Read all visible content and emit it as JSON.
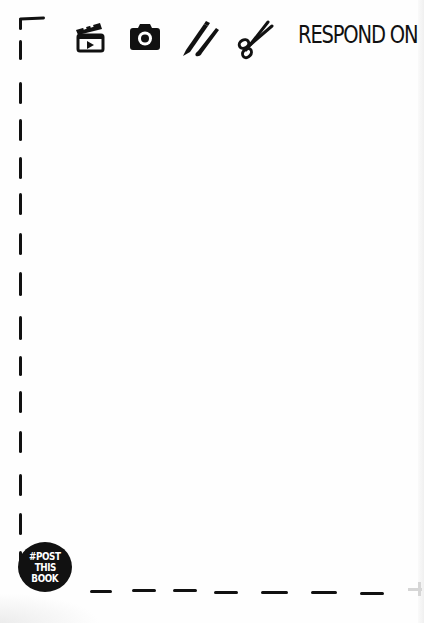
{
  "header": {
    "title": "RESPOND ON",
    "icons": [
      "film-clapper-icon",
      "camera-icon",
      "pen-and-brush-icon",
      "scissors-icon"
    ]
  },
  "badge": {
    "lines": [
      "#POST",
      "THIS",
      "BOOK"
    ]
  },
  "colors": {
    "ink": "#111111",
    "paper": "#fefefe"
  }
}
